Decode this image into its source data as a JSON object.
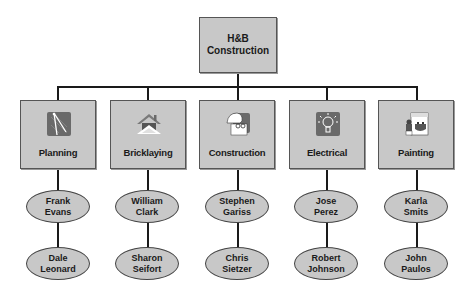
{
  "root": {
    "line1": "H&B",
    "line2": "Construction"
  },
  "departments": [
    {
      "name": "Planning",
      "icon": "drafting-compass-icon",
      "staff": [
        {
          "first": "Frank",
          "last": "Evans"
        },
        {
          "first": "Dale",
          "last": "Leonard"
        }
      ]
    },
    {
      "name": "Bricklaying",
      "icon": "house-roof-icon",
      "staff": [
        {
          "first": "William",
          "last": "Clark"
        },
        {
          "first": "Sharon",
          "last": "Seifort"
        }
      ]
    },
    {
      "name": "Construction",
      "icon": "hardhat-worker-icon",
      "staff": [
        {
          "first": "Stephen",
          "last": "Gariss"
        },
        {
          "first": "Chris",
          "last": "Sietzer"
        }
      ]
    },
    {
      "name": "Electrical",
      "icon": "lightbulb-icon",
      "staff": [
        {
          "first": "Jose",
          "last": "Perez"
        },
        {
          "first": "Robert",
          "last": "Johnson"
        }
      ]
    },
    {
      "name": "Painting",
      "icon": "painter-icon",
      "staff": [
        {
          "first": "Karla",
          "last": "Smits"
        },
        {
          "first": "John",
          "last": "Paulos"
        }
      ]
    }
  ],
  "colors": {
    "box_fill": "#c8c8c8",
    "line": "#1a1a1a",
    "icon_bg": "#6a6a6a"
  }
}
